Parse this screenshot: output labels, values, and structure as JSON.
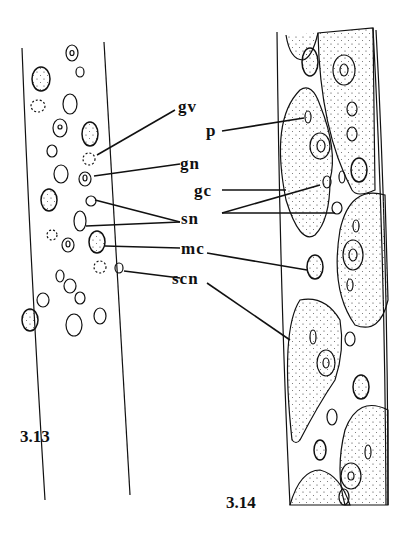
{
  "figures": [
    {
      "id": "3.13",
      "label": "3.13"
    },
    {
      "id": "3.14",
      "label": "3.14"
    }
  ],
  "labels": {
    "gv": "gv",
    "gn": "gn",
    "p": "p",
    "gc": "gc",
    "sn": "sn",
    "mc": "mc",
    "scn": "scn"
  },
  "colors": {
    "ink": "#111111",
    "background": "#ffffff"
  }
}
